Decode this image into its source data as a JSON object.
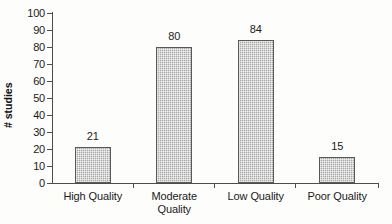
{
  "chart_data": {
    "type": "bar",
    "title": "",
    "subtitle": "",
    "xlabel": "",
    "ylabel": "# studies",
    "categories": [
      "High Quality",
      "Moderate Quality",
      "Low Quality",
      "Poor Quality"
    ],
    "category_lines": [
      [
        "High Quality"
      ],
      [
        "Moderate",
        "Quality"
      ],
      [
        "Low Quality"
      ],
      [
        "Poor Quality"
      ]
    ],
    "values": [
      21,
      80,
      84,
      15
    ],
    "value_labels": [
      "21",
      "80",
      "84",
      "15"
    ],
    "ylim": [
      0,
      100
    ],
    "ytick_step": 10,
    "yticks": [
      "100",
      "90",
      "80",
      "70",
      "60",
      "50",
      "40",
      "30",
      "20",
      "10",
      "0"
    ],
    "grid": false,
    "legend": null,
    "legend_position": "none",
    "colors": {
      "bar_fill": "#a8a8a8",
      "bar_border": "#595959",
      "axis": "#4d4d4d",
      "text": "#1a1a1a",
      "background": "#fdfdfc"
    }
  }
}
